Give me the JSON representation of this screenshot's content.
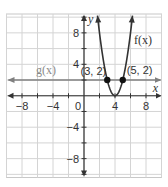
{
  "chart_data": {
    "type": "line",
    "title": "",
    "xlabel": "x",
    "ylabel": "y",
    "xlim": [
      -10,
      10
    ],
    "ylim": [
      -10.4,
      10.4
    ],
    "grid": true,
    "grid_step": 2,
    "legend": "none",
    "x_ticks": [
      -8,
      -4,
      0,
      4,
      8
    ],
    "x_tick_labels": [
      "−8",
      "−4",
      "0",
      "4",
      "8"
    ],
    "y_ticks": [
      8,
      4,
      -4,
      -8
    ],
    "y_tick_labels": [
      "8",
      "4",
      "−4",
      "−8"
    ],
    "series": [
      {
        "name": "f(x)",
        "label": "f(x)",
        "expression": "f(x) = 2(x − 4)^2",
        "kind": "parabola",
        "vertex": [
          4,
          0
        ],
        "color": "#333333",
        "x": [
          1.76,
          2,
          2.5,
          3,
          3.5,
          4,
          4.5,
          5,
          5.5,
          6,
          6.24
        ],
        "values": [
          10,
          8,
          4.5,
          2,
          0.5,
          0,
          0.5,
          2,
          4.5,
          8,
          10
        ]
      },
      {
        "name": "g(x)",
        "label": "g(x)",
        "expression": "g(x) = 2",
        "kind": "horizontal line",
        "color": "#808080",
        "x": [
          -10,
          10
        ],
        "values": [
          2,
          2
        ]
      }
    ],
    "points": [
      {
        "x": 3,
        "y": 2,
        "label": "(3, 2)"
      },
      {
        "x": 5,
        "y": 2,
        "label": "(5, 2)"
      }
    ],
    "annotations": [
      "f(x)",
      "g(x)",
      "(3, 2)",
      "(5, 2)"
    ]
  }
}
